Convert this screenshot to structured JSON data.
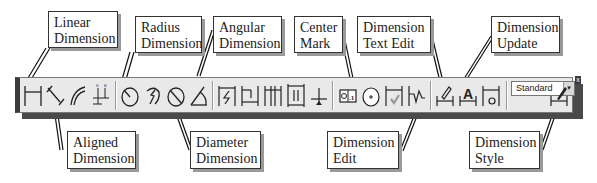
{
  "callouts_top": [
    {
      "id": "linear",
      "label": "Linear\nDimension"
    },
    {
      "id": "radius",
      "label": "Radius\nDimension"
    },
    {
      "id": "angular",
      "label": "Angular\nDimension"
    },
    {
      "id": "center",
      "label": "Center\nMark"
    },
    {
      "id": "text_edit",
      "label": "Dimension\nText Edit"
    },
    {
      "id": "update",
      "label": "Dimension\nUpdate"
    }
  ],
  "callouts_bottom": [
    {
      "id": "aligned",
      "label": "Aligned\nDimension"
    },
    {
      "id": "diameter",
      "label": "Diameter\nDimension"
    },
    {
      "id": "edit",
      "label": "Dimension\nEdit"
    },
    {
      "id": "style",
      "label": "Dimension\nStyle"
    }
  ],
  "toolbar": {
    "buttons": [
      {
        "name": "linear-dimension",
        "icon": "linear-dimension-icon"
      },
      {
        "name": "aligned-dimension",
        "icon": "aligned-dimension-icon"
      },
      {
        "name": "arc-length",
        "icon": "arc-length-icon"
      },
      {
        "name": "ordinate-dimension",
        "icon": "ordinate-dimension-icon"
      },
      {
        "name": "radius-dimension",
        "icon": "radius-dimension-icon"
      },
      {
        "name": "jogged-dimension",
        "icon": "jogged-dimension-icon"
      },
      {
        "name": "diameter-dimension",
        "icon": "diameter-dimension-icon"
      },
      {
        "name": "angular-dimension",
        "icon": "angular-dimension-icon"
      },
      {
        "name": "quick-dimension",
        "icon": "quick-dimension-icon"
      },
      {
        "name": "baseline-dimension",
        "icon": "baseline-dimension-icon"
      },
      {
        "name": "continue-dimension",
        "icon": "continue-dimension-icon"
      },
      {
        "name": "dimension-space",
        "icon": "dimension-space-icon"
      },
      {
        "name": "dimension-break",
        "icon": "dimension-break-icon"
      },
      {
        "name": "tolerance",
        "icon": "tolerance-icon"
      },
      {
        "name": "center-mark",
        "icon": "center-mark-icon"
      },
      {
        "name": "inspection",
        "icon": "inspection-icon"
      },
      {
        "name": "jogged-linear",
        "icon": "jogged-linear-icon"
      },
      {
        "name": "dimension-edit",
        "icon": "dimension-edit-icon"
      },
      {
        "name": "dimension-text-edit",
        "icon": "dimension-text-edit-icon"
      },
      {
        "name": "dimension-update",
        "icon": "dimension-update-icon"
      },
      {
        "name": "dimension-style",
        "icon": "dimension-style-icon"
      }
    ],
    "style_dropdown": {
      "value": "Standard"
    },
    "close_label": "x"
  }
}
